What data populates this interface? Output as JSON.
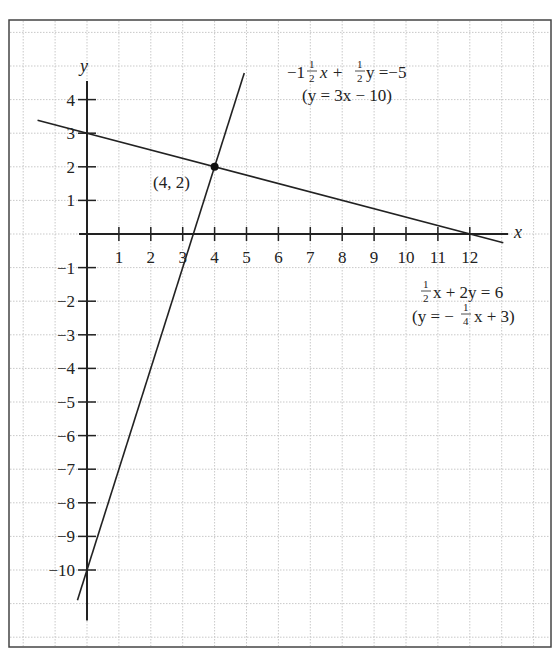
{
  "chart_data": {
    "type": "line",
    "title": "",
    "xlabel": "x",
    "ylabel": "y",
    "xlim": [
      -2.4,
      14
    ],
    "ylim": [
      -12.5,
      6.4
    ],
    "grid": true,
    "x_ticks": [
      1,
      2,
      3,
      4,
      5,
      6,
      7,
      8,
      9,
      10,
      11,
      12
    ],
    "y_ticks": [
      4,
      3,
      2,
      1,
      -1,
      -2,
      -3,
      -4,
      -5,
      -6,
      -7,
      -8,
      -9,
      -10
    ],
    "x_tick_labels": [
      "1",
      "2",
      "3",
      "4",
      "5",
      "6",
      "7",
      "8",
      "9",
      "10",
      "11",
      "12"
    ],
    "y_tick_labels": [
      "4",
      "3",
      "2",
      "1",
      "−1",
      "−2",
      "−3",
      "−4",
      "−5",
      "−6",
      "−7",
      "−8",
      "−9",
      "−10"
    ],
    "series": [
      {
        "name": "line-1",
        "equation_main": "−1½x + ½y = −5",
        "equation_alt": "(y = 3x − 10)",
        "slope": 3,
        "intercept": -10,
        "x_range": [
          -0.3,
          4.93
        ]
      },
      {
        "name": "line-2",
        "equation_main": "½x + 2y = 6",
        "equation_alt": "(y = −¼x + 3)",
        "slope": -0.25,
        "intercept": 3,
        "x_range": [
          -1.55,
          13.05
        ]
      }
    ],
    "annotations": [
      {
        "label": "(4, 2)",
        "x": 4,
        "y": 2,
        "type": "intersection-point"
      }
    ]
  },
  "labels": {
    "x_axis": "x",
    "y_axis": "y",
    "point": "(4, 2)",
    "eq1": {
      "lead": "−1",
      "x_term": "x +",
      "y_term": "y =−5",
      "alt": "(y = 3x − 10)"
    },
    "eq2": {
      "x_term": "x + 2y = 6",
      "alt_lead": "(y = −",
      "alt_tail": "x + 3)"
    },
    "frac_num": "1",
    "frac_den2": "2",
    "frac_den4": "4"
  }
}
